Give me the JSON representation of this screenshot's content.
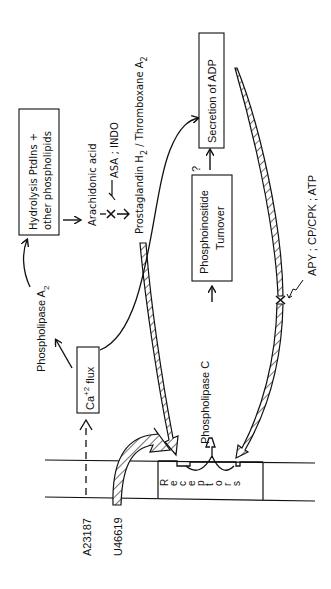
{
  "diagram": {
    "orientation": "rotated-90-ccw",
    "nodes": {
      "hydrolysis": {
        "line1": "Hydrolysis PtdIns +",
        "line2": "other phospholipids"
      },
      "arachidonic": "Arachidonic acid",
      "inhibitor_cox": "ASA ; INDO",
      "prostaglandin": {
        "main": "Prostaglandin H",
        "sub1": "2",
        "mid": " / Thromboxane A",
        "sub2": "2"
      },
      "phospholipase_a2": {
        "main": "Phospholipase A",
        "sub": "2"
      },
      "ca_flux": {
        "ca": "Ca",
        "sup": "+2",
        "rest": " flux"
      },
      "phospholipase_c": "Phospholipase C",
      "phosphoinositide": {
        "line1": "Phosphoinositide",
        "line2": "Turnover"
      },
      "secretion": "Secretion of ADP",
      "question": "?",
      "adp_inhibitors": "APY ; CP/CPK ; ATP",
      "ionophore": "A23187",
      "agonist": "U46619",
      "receptors": [
        "R",
        "e",
        "c",
        "e",
        "p",
        "t",
        "o",
        "r",
        "s"
      ]
    },
    "colors": {
      "ink": "#111111",
      "background": "#ffffff"
    }
  }
}
